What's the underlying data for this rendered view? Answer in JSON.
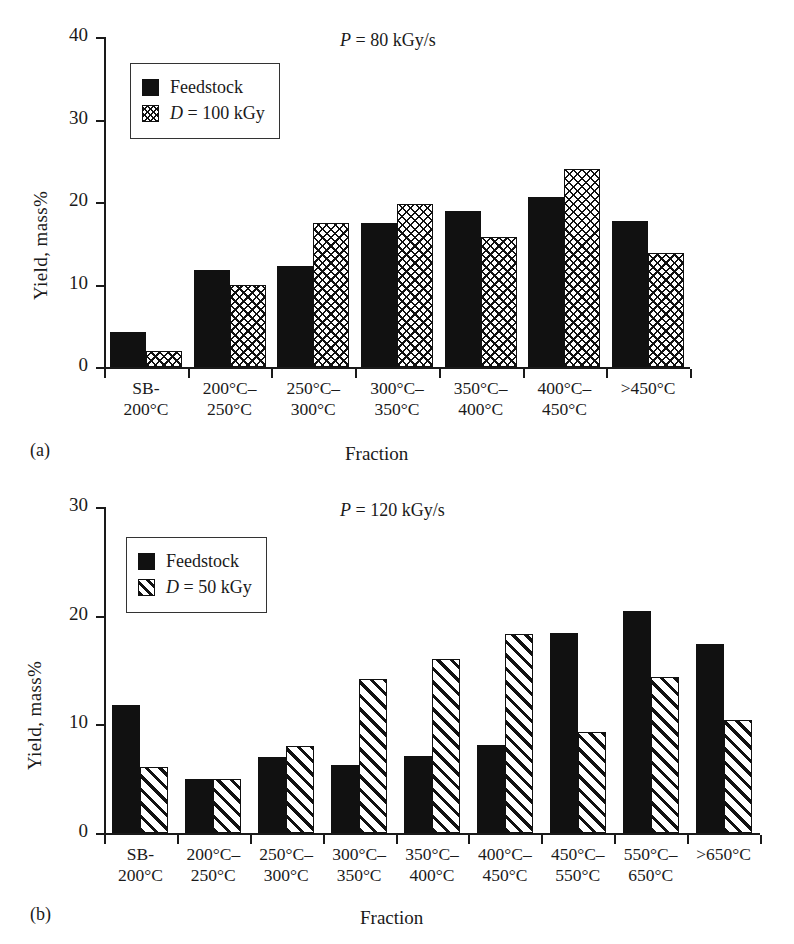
{
  "figure": {
    "panels": [
      {
        "caption": "(a)",
        "annotation": "P = 80 kGy/s",
        "annotation_italic": "P",
        "annotation_rest": " = 80 kGy/s",
        "ylabel": "Yield, mass%",
        "xlabel": "Fraction",
        "yticks": [
          "0",
          "10",
          "20",
          "30",
          "40"
        ],
        "legend": [
          {
            "label": "Feedstock",
            "pattern": "solid",
            "italic": "",
            "rest": "Feedstock"
          },
          {
            "label": "D = 100 kGy",
            "pattern": "cross",
            "italic": "D",
            "rest": " = 100 kGy"
          }
        ]
      },
      {
        "caption": "(b)",
        "annotation": "P = 120 kGy/s",
        "annotation_italic": "P",
        "annotation_rest": " = 120 kGy/s",
        "ylabel": "Yield, mass%",
        "xlabel": "Fraction",
        "yticks": [
          "0",
          "10",
          "20",
          "30"
        ],
        "legend": [
          {
            "label": "Feedstock",
            "pattern": "solid",
            "italic": "",
            "rest": "Feedstock"
          },
          {
            "label": "D = 50 kGy",
            "pattern": "diag",
            "italic": "D",
            "rest": " = 50 kGy"
          }
        ]
      }
    ]
  },
  "chart_data": [
    {
      "type": "bar",
      "panel": "(a)",
      "title": "P = 80 kGy/s",
      "xlabel": "Fraction",
      "ylabel": "Yield, mass%",
      "ylim": [
        0,
        40
      ],
      "yticks": [
        0,
        10,
        20,
        30,
        40
      ],
      "grid": false,
      "legend_position": "upper-left",
      "categories": [
        "SB-\n200°C",
        "200°C–\n250°C",
        "250°C–\n300°C",
        "300°C–\n350°C",
        "350°C–\n400°C",
        "400°C–\n450°C",
        ">450°C"
      ],
      "category_lines": [
        [
          "SB-",
          "200°C"
        ],
        [
          "200°C–",
          "250°C"
        ],
        [
          "250°C–",
          "300°C"
        ],
        [
          "300°C–",
          "350°C"
        ],
        [
          "350°C–",
          "400°C"
        ],
        [
          "400°C–",
          "450°C"
        ],
        [
          ">450°C",
          ""
        ]
      ],
      "series": [
        {
          "name": "Feedstock",
          "pattern": "solid",
          "values": [
            4.3,
            11.7,
            12.3,
            17.4,
            18.9,
            20.6,
            17.7
          ]
        },
        {
          "name": "D = 100 kGy",
          "pattern": "cross",
          "values": [
            1.9,
            9.9,
            17.5,
            19.8,
            15.7,
            24.0,
            13.8
          ]
        }
      ]
    },
    {
      "type": "bar",
      "panel": "(b)",
      "title": "P = 120 kGy/s",
      "xlabel": "Fraction",
      "ylabel": "Yield, mass%",
      "ylim": [
        0,
        30
      ],
      "yticks": [
        0,
        10,
        20,
        30
      ],
      "grid": false,
      "legend_position": "upper-left",
      "categories": [
        "SB-\n200°C",
        "200°C–\n250°C",
        "250°C–\n300°C",
        "300°C–\n350°C",
        "350°C–\n400°C",
        "400°C–\n450°C",
        "450°C–\n550°C",
        "550°C–\n650°C",
        ">650°C"
      ],
      "category_lines": [
        [
          "SB-",
          "200°C"
        ],
        [
          "200°C–",
          "250°C"
        ],
        [
          "250°C–",
          "300°C"
        ],
        [
          "300°C–",
          "350°C"
        ],
        [
          "350°C–",
          "400°C"
        ],
        [
          "400°C–",
          "450°C"
        ],
        [
          "450°C–",
          "550°C"
        ],
        [
          "550°C–",
          "650°C"
        ],
        [
          ">650°C",
          ""
        ]
      ],
      "series": [
        {
          "name": "Feedstock",
          "pattern": "solid",
          "values": [
            11.8,
            5.0,
            7.0,
            6.3,
            7.1,
            8.1,
            18.4,
            20.4,
            17.4
          ]
        },
        {
          "name": "D = 50 kGy",
          "pattern": "diag",
          "values": [
            6.1,
            5.0,
            8.0,
            14.2,
            16.0,
            18.3,
            9.3,
            14.4,
            10.4
          ]
        }
      ]
    }
  ],
  "colors": {
    "ink": "#111111",
    "background": "#ffffff"
  }
}
